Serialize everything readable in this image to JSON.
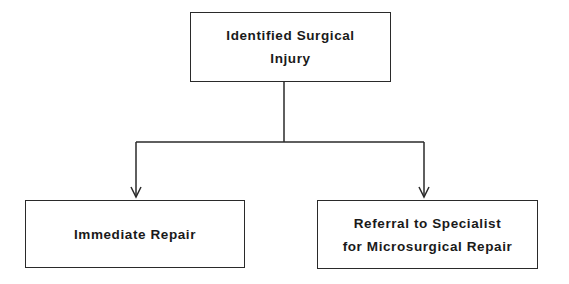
{
  "diagram": {
    "type": "flowchart",
    "root": {
      "lines": [
        "Identified Surgical",
        "Injury"
      ]
    },
    "branches": [
      {
        "lines": [
          "Immediate Repair"
        ]
      },
      {
        "lines": [
          "Referral to Specialist",
          "for Microsurgical Repair"
        ]
      }
    ],
    "edges": [
      {
        "from": "Identified Surgical Injury",
        "to": "Immediate Repair"
      },
      {
        "from": "Identified Surgical Injury",
        "to": "Referral to Specialist for Microsurgical Repair"
      }
    ],
    "colors": {
      "line": "#2a2a2a",
      "text": "#1a1a1a",
      "background": "#ffffff"
    }
  }
}
